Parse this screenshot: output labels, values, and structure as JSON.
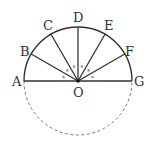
{
  "diagram": {
    "type": "geometry",
    "center": {
      "label": "O",
      "x": 78,
      "y": 81
    },
    "radius": 54,
    "points": [
      {
        "label": "A",
        "angle_deg": 180
      },
      {
        "label": "B",
        "angle_deg": 150
      },
      {
        "label": "C",
        "angle_deg": 120
      },
      {
        "label": "D",
        "angle_deg": 90
      },
      {
        "label": "E",
        "angle_deg": 60
      },
      {
        "label": "F",
        "angle_deg": 30
      },
      {
        "label": "G",
        "angle_deg": 0
      }
    ],
    "labels": {
      "A": "A",
      "B": "B",
      "C": "C",
      "D": "D",
      "E": "E",
      "F": "F",
      "G": "G",
      "O": "O"
    },
    "angle_marker": "•",
    "equal_angles_count": 6,
    "colors": {
      "line": "#333333",
      "dashed": "#777777",
      "marker": "#999999"
    }
  }
}
